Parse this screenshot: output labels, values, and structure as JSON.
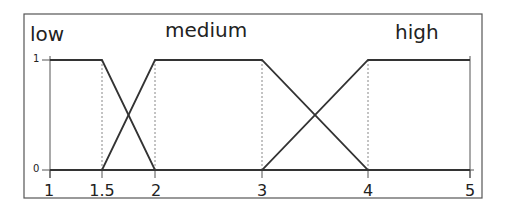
{
  "chart_data": {
    "type": "line",
    "title": "",
    "xlabel": "",
    "ylabel": "",
    "xlim": [
      1,
      5
    ],
    "ylim": [
      0,
      1
    ],
    "grid": false,
    "x_ticks": [
      "1",
      "1.5",
      "2",
      "3",
      "4",
      "5"
    ],
    "y_ticks": [
      "0",
      "1"
    ],
    "guide_lines_x": [
      1.5,
      2,
      3,
      4
    ],
    "series": [
      {
        "name": "low",
        "x": [
          1,
          1.5,
          2,
          5
        ],
        "y": [
          1,
          1,
          0,
          0
        ]
      },
      {
        "name": "medium",
        "x": [
          1,
          1.5,
          2,
          3,
          4,
          5
        ],
        "y": [
          0,
          0,
          1,
          1,
          0,
          0
        ]
      },
      {
        "name": "high",
        "x": [
          1,
          3,
          4,
          5
        ],
        "y": [
          0,
          0,
          1,
          1
        ]
      }
    ],
    "annotations": [
      "low",
      "medium",
      "high"
    ]
  },
  "labels": {
    "low": "low",
    "medium": "medium",
    "high": "high",
    "x_ticks": [
      "1",
      "1.5",
      "2",
      "3",
      "4",
      "5"
    ],
    "y_ticks": [
      "0",
      "1"
    ]
  },
  "colors": {
    "line": "#333333",
    "frame": "#555555",
    "guide": "#888888"
  }
}
